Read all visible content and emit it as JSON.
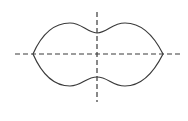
{
  "diagram": {
    "colors": {
      "background": "#ffffff",
      "outline": "#3a3a3a",
      "axes": "#3a3a3a"
    },
    "axes": {
      "horizontal": {
        "x1": 15,
        "x2": 180,
        "y": 54,
        "dash": "5 3"
      },
      "vertical": {
        "x": 97,
        "y1": 12,
        "y2": 102,
        "dash": "5 3"
      }
    },
    "shape": {
      "left_tip": [
        33,
        54
      ],
      "right_tip": [
        163,
        54
      ],
      "top_lobe_peaks": [
        [
          70,
          23
        ],
        [
          125,
          23
        ]
      ],
      "bottom_lobe_peaks": [
        [
          70,
          86
        ],
        [
          125,
          86
        ]
      ],
      "top_pinch": [
        97,
        33
      ],
      "bottom_pinch": [
        97,
        77
      ]
    }
  }
}
